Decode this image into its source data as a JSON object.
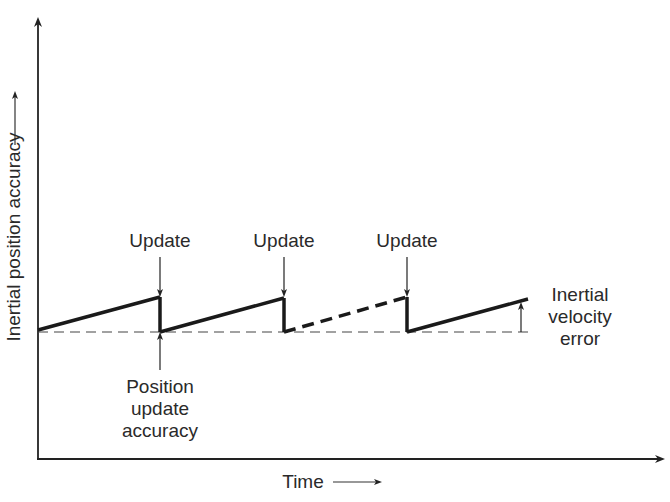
{
  "diagram": {
    "y_axis_label": "Inertial position accuracy",
    "x_axis_label": "Time",
    "update_labels": [
      "Update",
      "Update",
      "Update"
    ],
    "position_update_label": [
      "Position",
      "update",
      "accuracy"
    ],
    "velocity_error_label": [
      "Inertial",
      "velocity",
      "error"
    ]
  }
}
